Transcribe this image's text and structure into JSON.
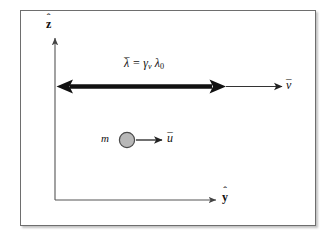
{
  "figure": {
    "background_color": "#ffffff",
    "frame_border_color": "#6e6e6e",
    "axes": {
      "z_axis": {
        "label_base": "z",
        "label_accent": "ˆ",
        "name": "z-hat"
      },
      "y_axis": {
        "label_base": "y",
        "label_accent": "ˆ",
        "name": "y-hat"
      }
    },
    "equation": {
      "lambda_base": "λ",
      "lambda_accent": "–",
      "equals": "=",
      "gamma": "γ",
      "gamma_subscript": "v",
      "lambda0_base": "λ",
      "lambda0_subscript": "0",
      "plain_text": "λ̄ = γ_v λ_0"
    },
    "velocity_vector": {
      "label_base": "v",
      "label_accent": "–",
      "plain_text": "v̄"
    },
    "particle": {
      "mass_label": "m",
      "fill_color": "#b8b8b8",
      "stroke_color": "#4a4a4a"
    },
    "particle_vector": {
      "label_base": "u",
      "label_accent": "–",
      "plain_text": "ū"
    },
    "arrow_colors": {
      "thick_arrow": "#111111",
      "thin_arrow": "#3a3a3a",
      "axis": "#555555"
    }
  }
}
